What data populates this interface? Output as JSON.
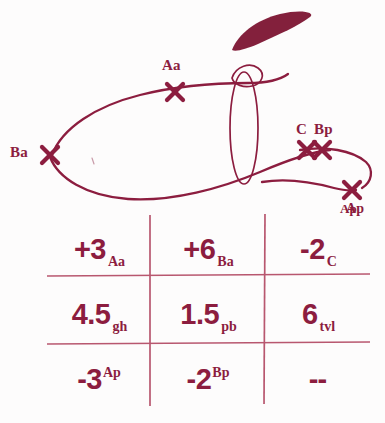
{
  "document": {
    "kind": "handwritten-annotated-figure",
    "ink_color": "#8c1d3f",
    "rule_color": "#b8576f",
    "background": "#fdfcfc"
  },
  "diagram": {
    "title_region": "annotated scribble over ultrasound-style tracing",
    "blob": {
      "name": "solid-wedge-shape"
    },
    "ellipse": {
      "name": "vertical-ellipse-outline"
    },
    "markers": [
      {
        "id": "aa",
        "label": "Aa",
        "label_pos": "above",
        "x": 175,
        "y": 92,
        "label_x": 163,
        "label_y": 61
      },
      {
        "id": "ba",
        "label": "Ba",
        "label_pos": "left",
        "x": 50,
        "y": 155,
        "label_x": 10,
        "label_y": 147
      },
      {
        "id": "c",
        "label": "C",
        "label_pos": "above",
        "x": 307,
        "y": 150,
        "label_x": 297,
        "label_y": 124
      },
      {
        "id": "bp",
        "label": "Bp",
        "label_pos": "above",
        "x": 322,
        "y": 150,
        "label_x": 317,
        "label_y": 124
      },
      {
        "id": "ap",
        "label": "Ap",
        "label_pos": "below",
        "x": 352,
        "y": 190,
        "label_x": 340,
        "label_y": 205
      }
    ]
  },
  "table": {
    "rows": [
      {
        "name": "row-1",
        "cells": [
          {
            "name": "cell-aa",
            "value": "+3",
            "sub": "Aa",
            "sup": ""
          },
          {
            "name": "cell-ba",
            "value": "+6",
            "sub": "Ba",
            "sup": ""
          },
          {
            "name": "cell-c",
            "value": "-2",
            "sub": "C",
            "sup": "Ap"
          }
        ]
      },
      {
        "name": "row-2",
        "cells": [
          {
            "name": "cell-gh",
            "value": "4.5",
            "sub": "gh",
            "sup": ""
          },
          {
            "name": "cell-pb",
            "value": "1.5",
            "sub": "pb",
            "sup": ""
          },
          {
            "name": "cell-tvl",
            "value": "6",
            "sub": "tvl",
            "sup": ""
          }
        ]
      },
      {
        "name": "row-3",
        "cells": [
          {
            "name": "cell-ap",
            "value": "-3",
            "sub": "",
            "sup": "Ap"
          },
          {
            "name": "cell-bp",
            "value": "-2",
            "sub": "",
            "sup": "Bp"
          },
          {
            "name": "cell-dash",
            "value": "--",
            "sub": "",
            "sup": ""
          }
        ]
      }
    ]
  }
}
